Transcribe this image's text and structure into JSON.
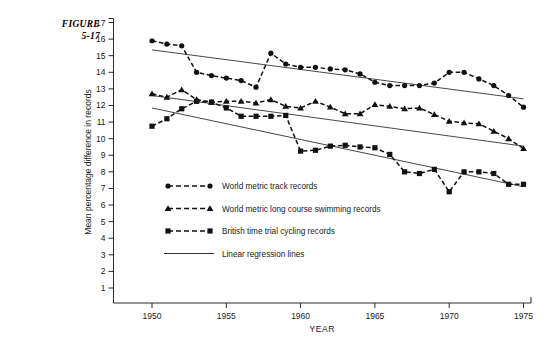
{
  "figure": {
    "label_line1": "FIGURE",
    "label_line2": "5-17"
  },
  "chart_data": {
    "type": "line",
    "title": "",
    "subtitle": "",
    "xlabel": "YEAR",
    "ylabel": "Mean percentage difference in records",
    "xlim": [
      1948,
      1976
    ],
    "ylim": [
      0,
      17
    ],
    "grid": false,
    "legend_position": "inside-lower-left",
    "x_ticks": [
      1950,
      1955,
      1960,
      1965,
      1970,
      1975
    ],
    "y_ticks": [
      1,
      2,
      3,
      4,
      5,
      6,
      7,
      8,
      9,
      10,
      11,
      12,
      13,
      14,
      15,
      16,
      17
    ],
    "x": [
      1950,
      1951,
      1952,
      1953,
      1954,
      1955,
      1956,
      1957,
      1958,
      1959,
      1960,
      1961,
      1962,
      1963,
      1964,
      1965,
      1966,
      1967,
      1968,
      1969,
      1970,
      1971,
      1972,
      1973,
      1974,
      1975
    ],
    "series": [
      {
        "name": "World metric track records",
        "marker": "circle",
        "linestyle": "dashed",
        "color": "#111111",
        "values": [
          15.9,
          15.7,
          15.6,
          14.0,
          13.8,
          13.65,
          13.5,
          13.1,
          15.15,
          14.5,
          14.3,
          14.3,
          14.2,
          14.15,
          13.9,
          13.4,
          13.2,
          13.2,
          13.2,
          13.35,
          14.0,
          14.0,
          13.6,
          13.2,
          12.6,
          11.9
        ]
      },
      {
        "name": "World metric long course swimming records",
        "marker": "triangle",
        "linestyle": "dashed",
        "color": "#111111",
        "values": [
          12.7,
          12.5,
          12.95,
          12.35,
          12.2,
          12.25,
          12.25,
          12.15,
          12.35,
          11.95,
          11.85,
          12.25,
          11.9,
          11.5,
          11.5,
          12.05,
          11.95,
          11.8,
          11.85,
          11.45,
          11.05,
          10.95,
          10.9,
          10.45,
          10.0,
          9.4
        ]
      },
      {
        "name": "British time trial cycling records",
        "marker": "square",
        "linestyle": "dashed",
        "color": "#111111",
        "values": [
          10.75,
          11.2,
          11.8,
          12.25,
          12.2,
          11.85,
          11.35,
          11.35,
          11.35,
          11.4,
          9.25,
          9.3,
          9.55,
          9.6,
          9.5,
          9.45,
          9.05,
          8.0,
          7.9,
          8.15,
          6.8,
          8.0,
          8.0,
          7.9,
          7.25,
          7.25
        ]
      }
    ],
    "regression_lines": [
      {
        "name": "Track regression",
        "x1": 1950,
        "y1": 15.35,
        "x2": 1975,
        "y2": 12.4
      },
      {
        "name": "Swimming regression",
        "x1": 1950,
        "y1": 12.6,
        "x2": 1975,
        "y2": 9.55
      },
      {
        "name": "Cycling regression",
        "x1": 1950,
        "y1": 11.85,
        "x2": 1975,
        "y2": 7.1
      }
    ],
    "legend": [
      {
        "label": "World metric track records",
        "marker": "circle",
        "linestyle": "dashed"
      },
      {
        "label": "World metric long course swimming records",
        "marker": "triangle",
        "linestyle": "dashed"
      },
      {
        "label": "British time trial cycling records",
        "marker": "square",
        "linestyle": "dashed"
      },
      {
        "label": "Linear regression lines",
        "marker": "none",
        "linestyle": "solid"
      }
    ]
  }
}
